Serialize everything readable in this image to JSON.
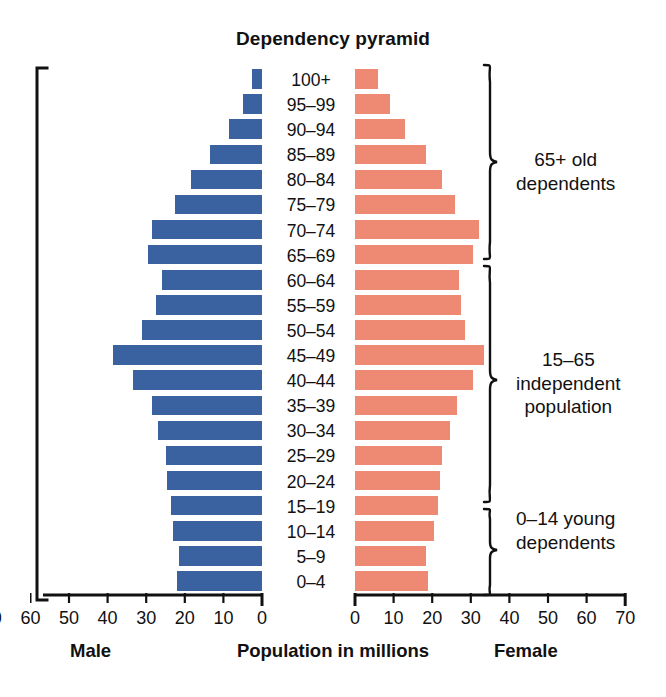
{
  "chart_data": {
    "type": "bar",
    "subtype": "population-pyramid",
    "title": "Dependency pyramid",
    "xlabel": "Population in millions",
    "ylabel": "",
    "grid": false,
    "legend_position": "none",
    "xlim_left": [
      70,
      0
    ],
    "xlim_right": [
      0,
      70
    ],
    "categories": [
      "100+",
      "95–99",
      "90–94",
      "85–89",
      "80–84",
      "75–79",
      "70–74",
      "65–69",
      "60–64",
      "55–59",
      "50–54",
      "45–49",
      "40–44",
      "35–39",
      "30–34",
      "25–29",
      "20–24",
      "15–19",
      "10–14",
      "5–9",
      "0–4"
    ],
    "series": [
      {
        "name": "Male",
        "color": "#3a61a0",
        "side": "left",
        "values": [
          2.5,
          5.0,
          8.5,
          13.5,
          18.5,
          22.5,
          28.5,
          29.5,
          26.0,
          27.5,
          31.0,
          38.5,
          33.5,
          28.5,
          27.0,
          25.0,
          24.5,
          23.5,
          23.0,
          21.5,
          22.0
        ]
      },
      {
        "name": "Female",
        "color": "#ee8a74",
        "side": "right",
        "values": [
          6.0,
          9.0,
          13.0,
          18.5,
          22.5,
          26.0,
          32.0,
          30.5,
          27.0,
          27.5,
          28.5,
          33.5,
          30.5,
          26.5,
          24.5,
          22.5,
          22.0,
          21.5,
          20.5,
          18.5,
          19.0
        ]
      }
    ],
    "xticks_left": [
      70,
      60,
      50,
      40,
      30,
      20,
      10,
      0
    ],
    "xticks_right": [
      0,
      10,
      20,
      30,
      40,
      50,
      60,
      70
    ],
    "axis_left_caption": "Male",
    "axis_right_caption": "Female",
    "annotations": [
      {
        "id": "old",
        "text_lines": [
          "65+ old",
          "dependents"
        ],
        "covers": "65–69 through 100+"
      },
      {
        "id": "indep",
        "text_lines": [
          "15–65",
          "independent",
          "population"
        ],
        "covers": "15–19 through 60–64"
      },
      {
        "id": "young",
        "text_lines": [
          "0–14 young",
          "dependents"
        ],
        "covers": "0–4 through 10–14"
      }
    ]
  },
  "colors": {
    "male_bar": "#3a61a0",
    "female_bar": "#ee8a74",
    "text": "#111111",
    "axis": "#000000",
    "background": "#ffffff"
  }
}
